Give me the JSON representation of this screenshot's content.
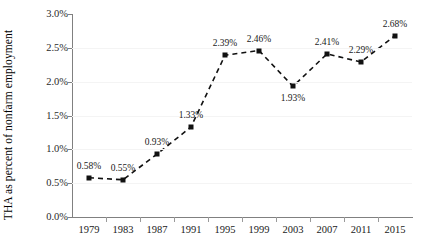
{
  "chart_data": {
    "type": "line",
    "title": "",
    "subtitle": "",
    "xlabel": "",
    "ylabel": "THA as percent of nonfarm employment",
    "categories": [
      "1979",
      "1983",
      "1987",
      "1991",
      "1995",
      "1999",
      "2003",
      "2007",
      "2011",
      "2015"
    ],
    "values": [
      0.58,
      0.55,
      0.93,
      1.33,
      2.39,
      2.46,
      1.93,
      2.41,
      2.29,
      2.68
    ],
    "point_labels": [
      "0.58%",
      "0.55%",
      "0.93%",
      "1.33%",
      "2.39%",
      "2.46%",
      "1.93%",
      "2.41%",
      "2.29%",
      "2.68%"
    ],
    "label_positions": [
      "above",
      "above",
      "above",
      "above",
      "above",
      "above",
      "below",
      "above",
      "above",
      "above"
    ],
    "ylim": [
      0.0,
      3.0
    ],
    "ytick_values": [
      0.0,
      0.5,
      1.0,
      1.5,
      2.0,
      2.5,
      3.0
    ],
    "ytick_labels": [
      "0.0%",
      "0.5%",
      "1.0%",
      "1.5%",
      "2.0%",
      "2.5%",
      "3.0%"
    ],
    "grid": true,
    "legend": false,
    "legend_position": "none",
    "line_style": "dashed",
    "marker": "square",
    "series_color": "#111111",
    "grid_color": "#f4f4f4",
    "axis_color": "#808080"
  }
}
